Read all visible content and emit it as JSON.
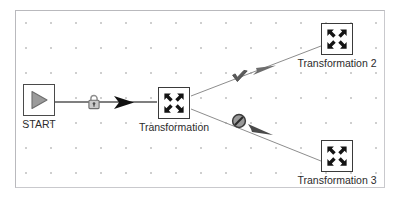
{
  "canvas": {
    "title": "Pipeline Canvas",
    "grid": "dotted",
    "grid_spacing": 25,
    "background_color": "#ffffff",
    "grid_dot_color": "#cfcfcf",
    "border_color": "#b9b9bd"
  },
  "nodes": [
    {
      "id": "start",
      "label": "START",
      "icon": "play-triangle-icon",
      "type": "start",
      "x": 38,
      "y": 99,
      "icon_color": "#8a8a8a"
    },
    {
      "id": "transformation",
      "label": "Transformation",
      "icon": "transformation-converge-icon",
      "type": "transformation",
      "x": 173,
      "y": 102,
      "icon_color": "#1d1d1d"
    },
    {
      "id": "transformation-2",
      "label": "Transformation 2",
      "icon": "transformation-converge-icon",
      "type": "transformation",
      "x": 336,
      "y": 38,
      "icon_color": "#1d1d1d"
    },
    {
      "id": "transformation-3",
      "label": "Transformation 3",
      "icon": "transformation-converge-icon",
      "type": "transformation",
      "x": 336,
      "y": 155,
      "icon_color": "#1d1d1d"
    }
  ],
  "links": [
    {
      "id": "link-start-to-transformation",
      "from": "START",
      "to": "Transformation",
      "badge_icon": "padlock-icon",
      "badge_label": "locked",
      "line_color": "#555555",
      "badge_x": 93,
      "badge_y": 101,
      "arrow_x": 127,
      "arrow_y": 102
    },
    {
      "id": "link-transformation-to-transformation-2",
      "from": "Transformation",
      "to": "Transformation 2",
      "badge_icon": "checkmark-icon",
      "badge_label": "success",
      "line_color": "#8d8d8d",
      "badge_x": 239,
      "badge_y": 76,
      "arrow_x": 271,
      "arrow_y": 62
    },
    {
      "id": "link-transformation-to-transformation-3",
      "from": "Transformation",
      "to": "Transformation 3",
      "badge_icon": "prohibited-icon",
      "badge_label": "error",
      "line_color": "#8d8d8d",
      "badge_x": 238,
      "badge_y": 120,
      "arrow_x": 268,
      "arrow_y": 132
    }
  ],
  "colors": {
    "node_border": "#3a3a3a",
    "label_text": "#2b2b2b",
    "start_icon": "#8a8a8a",
    "link_primary": "#555555",
    "link_secondary": "#8d8d8d",
    "badge_fill": "#9a9a9a",
    "arrow_fill": "#111111"
  }
}
